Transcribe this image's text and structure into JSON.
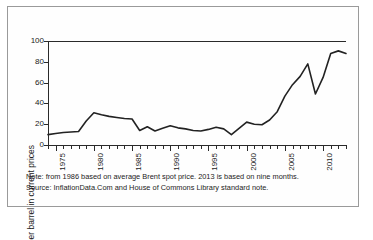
{
  "figure": {
    "y_axis_title": "US $ per barrel in current prices",
    "notes": [
      "Note: from 1986 based on average Brent spot price. 2013 is based on nine months.",
      "Source: InflationData.Com and House of Commons Library standard note."
    ]
  },
  "chart_data": {
    "type": "line",
    "title": "",
    "xlabel": "",
    "ylabel": "US $ per barrel in current prices",
    "xlim": [
      1974,
      2013
    ],
    "ylim": [
      0,
      100
    ],
    "yticks": [
      0,
      20,
      40,
      60,
      80,
      100
    ],
    "xticks_major": [
      1975,
      1980,
      1985,
      1990,
      1995,
      2000,
      2005,
      2010
    ],
    "xtick_labels": [
      "1975",
      "1980",
      "1985",
      "1990",
      "1995",
      "2000",
      "2005",
      "2010"
    ],
    "grid": false,
    "legend": "none",
    "line_color": "#222222",
    "x": [
      1974,
      1975,
      1976,
      1977,
      1978,
      1979,
      1980,
      1981,
      1982,
      1983,
      1984,
      1985,
      1986,
      1987,
      1988,
      1989,
      1990,
      1991,
      1992,
      1993,
      1994,
      1995,
      1996,
      1997,
      1998,
      1999,
      2000,
      2001,
      2002,
      2003,
      2004,
      2005,
      2006,
      2007,
      2008,
      2009,
      2010,
      2011,
      2012,
      2013
    ],
    "values": [
      10,
      11,
      12,
      12.5,
      13,
      23,
      31,
      29,
      27.5,
      26.5,
      25.5,
      25,
      14,
      17.5,
      13.5,
      16,
      18.5,
      16.5,
      15.5,
      14,
      13.5,
      15,
      17,
      15.5,
      10,
      16,
      22,
      20,
      19.5,
      24,
      32,
      47,
      58,
      66,
      78,
      49,
      65,
      88,
      90.5,
      88
    ],
    "series": [
      {
        "name": "US $ per barrel in current prices",
        "values": [
          10,
          11,
          12,
          12.5,
          13,
          23,
          31,
          29,
          27.5,
          26.5,
          25.5,
          25,
          14,
          17.5,
          13.5,
          16,
          18.5,
          16.5,
          15.5,
          14,
          13.5,
          15,
          17,
          15.5,
          10,
          16,
          22,
          20,
          19.5,
          24,
          32,
          47,
          58,
          66,
          78,
          49,
          65,
          88,
          90.5,
          88
        ]
      }
    ],
    "annotations": [
      "Note: from 1986 based on average Brent spot price. 2013 is based on nine months.",
      "Source: InflationData.Com and House of Commons Library standard note."
    ]
  }
}
